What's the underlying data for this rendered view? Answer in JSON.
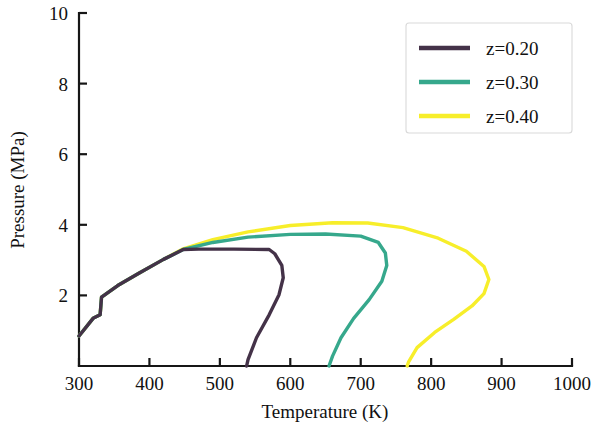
{
  "chart_data": {
    "type": "line",
    "title": "",
    "xlabel": "Temperature (K)",
    "ylabel": "Pressure (MPa)",
    "xlim": [
      300,
      1000
    ],
    "ylim": [
      0,
      10
    ],
    "xticks": [
      300,
      400,
      500,
      600,
      700,
      800,
      900,
      1000
    ],
    "yticks": [
      2,
      4,
      6,
      8,
      10
    ],
    "xtick_labels": [
      "300",
      "400",
      "500",
      "600",
      "700",
      "800",
      "900",
      "1000"
    ],
    "ytick_labels": [
      "2",
      "4",
      "6",
      "8",
      "10"
    ],
    "grid": false,
    "legend_position": "upper right",
    "series": [
      {
        "name": "z=0.20",
        "color": "#443248",
        "points": [
          [
            300,
            0.85
          ],
          [
            320,
            1.35
          ],
          [
            330,
            1.45
          ],
          [
            332,
            1.95
          ],
          [
            355,
            2.28
          ],
          [
            385,
            2.63
          ],
          [
            420,
            3.02
          ],
          [
            448,
            3.3
          ],
          [
            470,
            3.31
          ],
          [
            520,
            3.31
          ],
          [
            570,
            3.3
          ],
          [
            578,
            3.18
          ],
          [
            588,
            2.85
          ],
          [
            590,
            2.5
          ],
          [
            584,
            2.02
          ],
          [
            570,
            1.45
          ],
          [
            552,
            0.8
          ],
          [
            540,
            0.18
          ],
          [
            538,
            0.0
          ]
        ]
      },
      {
        "name": "z=0.30",
        "color": "#36a88c",
        "points": [
          [
            300,
            0.85
          ],
          [
            320,
            1.35
          ],
          [
            330,
            1.45
          ],
          [
            332,
            1.95
          ],
          [
            355,
            2.28
          ],
          [
            385,
            2.63
          ],
          [
            420,
            3.02
          ],
          [
            448,
            3.3
          ],
          [
            490,
            3.5
          ],
          [
            540,
            3.65
          ],
          [
            600,
            3.73
          ],
          [
            650,
            3.74
          ],
          [
            700,
            3.68
          ],
          [
            725,
            3.5
          ],
          [
            735,
            3.2
          ],
          [
            737,
            2.85
          ],
          [
            730,
            2.4
          ],
          [
            712,
            1.88
          ],
          [
            690,
            1.35
          ],
          [
            672,
            0.8
          ],
          [
            660,
            0.28
          ],
          [
            655,
            0.0
          ]
        ]
      },
      {
        "name": "z=0.40",
        "color": "#f7ee2a",
        "points": [
          [
            300,
            0.85
          ],
          [
            320,
            1.35
          ],
          [
            330,
            1.45
          ],
          [
            332,
            1.95
          ],
          [
            355,
            2.28
          ],
          [
            385,
            2.63
          ],
          [
            420,
            3.02
          ],
          [
            448,
            3.32
          ],
          [
            490,
            3.58
          ],
          [
            540,
            3.8
          ],
          [
            600,
            3.98
          ],
          [
            660,
            4.06
          ],
          [
            710,
            4.05
          ],
          [
            760,
            3.92
          ],
          [
            810,
            3.62
          ],
          [
            850,
            3.25
          ],
          [
            875,
            2.82
          ],
          [
            882,
            2.45
          ],
          [
            875,
            2.05
          ],
          [
            858,
            1.7
          ],
          [
            832,
            1.32
          ],
          [
            805,
            0.95
          ],
          [
            780,
            0.52
          ],
          [
            768,
            0.12
          ],
          [
            766,
            0.0
          ]
        ]
      }
    ]
  },
  "legend": {
    "entries": [
      {
        "label": "z=0.20",
        "color": "#443248"
      },
      {
        "label": "z=0.30",
        "color": "#36a88c"
      },
      {
        "label": "z=0.40",
        "color": "#f7ee2a"
      }
    ]
  }
}
